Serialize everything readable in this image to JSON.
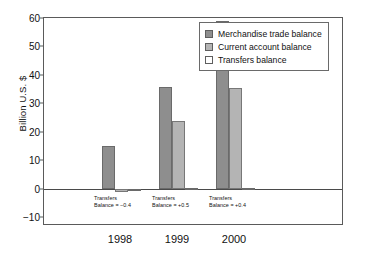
{
  "chart_data": {
    "type": "bar",
    "title": "",
    "xlabel": "",
    "ylabel": "Billion U.S. $",
    "categories": [
      "1998",
      "1999",
      "2000"
    ],
    "ylim": [
      -13,
      60
    ],
    "yticks": [
      60,
      50,
      40,
      30,
      20,
      10,
      0,
      -10
    ],
    "ytick_labels": [
      "60",
      "50",
      "40",
      "30",
      "20",
      "10",
      "0",
      "−10"
    ],
    "grid": false,
    "legend_position": "top-right",
    "series": [
      {
        "name": "Merchandise trade balance",
        "color": "#8e8e8e",
        "values": [
          15,
          35.7,
          59
        ]
      },
      {
        "name": "Current account balance",
        "color": "#b4b4b4",
        "values": [
          -1.1,
          24,
          35.4
        ]
      },
      {
        "name": "Transfers balance",
        "color": "#ffffff",
        "values": [
          -0.4,
          0.5,
          0.4
        ]
      }
    ],
    "annotations": [
      {
        "category": "1998",
        "line1": "Transfers",
        "line2": "Balance = −0.4"
      },
      {
        "category": "1999",
        "line1": "Transfers",
        "line2": "Balance = +0.5"
      },
      {
        "category": "2000",
        "line1": "Transfers",
        "line2": "Balance = +0.4"
      }
    ]
  },
  "legend": {
    "items": [
      {
        "label": "Merchandise trade balance"
      },
      {
        "label": "Current account balance"
      },
      {
        "label": "Transfers balance"
      }
    ]
  }
}
